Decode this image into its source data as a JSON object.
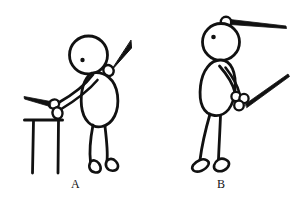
{
  "figure": {
    "background_color": "#ffffff",
    "ink_color": "#111111",
    "panels": [
      {
        "id": "panel-a",
        "label": "A",
        "label_position": {
          "x": 71,
          "y": 178
        },
        "description": "Stick figure bending forward, one hand gripping a stick resting on a table, a second stick held back over the shoulder",
        "parts": [
          {
            "name": "head",
            "shape": "circle"
          },
          {
            "name": "eye",
            "shape": "dot"
          },
          {
            "name": "torso",
            "shape": "oval"
          },
          {
            "name": "arm",
            "shape": "line"
          },
          {
            "name": "hand-grip",
            "shape": "small-oval"
          },
          {
            "name": "shoulder-hand",
            "shape": "small-oval"
          },
          {
            "name": "stick-lower",
            "shape": "tapered-line"
          },
          {
            "name": "stick-upper",
            "shape": "tapered-line"
          },
          {
            "name": "table",
            "shape": "top-with-two-legs"
          },
          {
            "name": "leg-front",
            "shape": "line"
          },
          {
            "name": "leg-back",
            "shape": "line"
          },
          {
            "name": "foot-front",
            "shape": "wedge"
          },
          {
            "name": "foot-back",
            "shape": "wedge"
          }
        ]
      },
      {
        "id": "panel-b",
        "label": "B",
        "label_position": {
          "x": 217,
          "y": 178
        },
        "description": "Stick figure standing upright, one hand balancing a stick on top of the head, the other hand gripping a stick at hip level",
        "parts": [
          {
            "name": "head",
            "shape": "circle"
          },
          {
            "name": "eye",
            "shape": "dot"
          },
          {
            "name": "torso",
            "shape": "oval"
          },
          {
            "name": "arm",
            "shape": "line"
          },
          {
            "name": "head-hand",
            "shape": "small-circle"
          },
          {
            "name": "finger-cluster",
            "shape": "three-circles"
          },
          {
            "name": "stick-upper",
            "shape": "tapered-line"
          },
          {
            "name": "stick-lower",
            "shape": "tapered-line"
          },
          {
            "name": "leg-front",
            "shape": "line"
          },
          {
            "name": "leg-back",
            "shape": "line"
          },
          {
            "name": "foot-front",
            "shape": "wedge"
          },
          {
            "name": "foot-back",
            "shape": "wedge"
          }
        ]
      }
    ]
  }
}
